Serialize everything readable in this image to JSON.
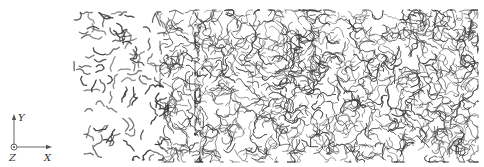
{
  "figure": {
    "background": "#ffffff",
    "ink_color": "#3a3a3a"
  },
  "axes": {
    "y_label": "Y",
    "x_label": "X",
    "z_label": "Z",
    "color": "#555555"
  },
  "regions": [
    {
      "name": "sparse",
      "x0": 74,
      "x1": 168,
      "y0": 12,
      "y1": 160,
      "count": 110,
      "segments": 3,
      "seglen": 3.2,
      "width": 1.3
    },
    {
      "name": "transition",
      "x0": 160,
      "x1": 200,
      "y0": 10,
      "y1": 162,
      "count": 120,
      "segments": 5,
      "seglen": 3.0,
      "width": 0.9
    },
    {
      "name": "dense",
      "x0": 195,
      "x1": 478,
      "y0": 10,
      "y1": 162,
      "count": 1100,
      "segments": 6,
      "seglen": 2.8,
      "width": 0.8
    }
  ]
}
